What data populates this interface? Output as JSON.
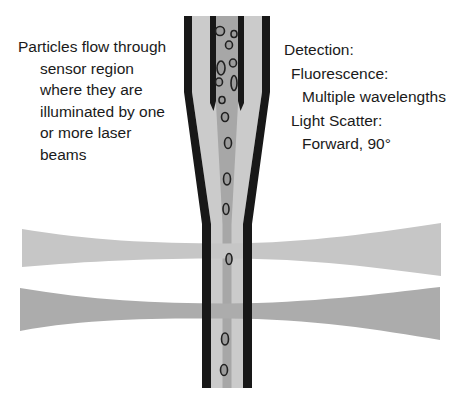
{
  "left_note": {
    "lines": [
      "Particles flow through",
      "sensor region",
      "where they are",
      "illuminated by one",
      "or more laser",
      "beams"
    ]
  },
  "detection_panel": {
    "title": "Detection:",
    "items": [
      {
        "label": "Fluorescence:",
        "detail": "Multiple wavelengths"
      },
      {
        "label": "Light Scatter:",
        "detail": "Forward, 90°"
      }
    ]
  },
  "colors": {
    "background": "#ffffff",
    "text": "#1a1a1a",
    "wall": "#181818",
    "sheath": "#cbcbcb",
    "core": "#a7a7a7",
    "beam_upper": "#c6c6c6",
    "beam_lower": "#acacac",
    "particle_fill": "#9b9b9b",
    "particle_stroke": "#202020"
  },
  "diagram": {
    "particles": [
      {
        "cx": 220,
        "cy": 31,
        "rx": 4.5,
        "ry": 4.5
      },
      {
        "cx": 234,
        "cy": 34,
        "rx": 3,
        "ry": 3.5
      },
      {
        "cx": 229,
        "cy": 45,
        "rx": 3.5,
        "ry": 4
      },
      {
        "cx": 233,
        "cy": 63,
        "rx": 3.5,
        "ry": 4
      },
      {
        "cx": 221,
        "cy": 68,
        "rx": 4,
        "ry": 7
      },
      {
        "cx": 219,
        "cy": 82,
        "rx": 3.5,
        "ry": 4
      },
      {
        "cx": 234,
        "cy": 83,
        "rx": 3,
        "ry": 7.5
      },
      {
        "cx": 222,
        "cy": 100,
        "rx": 3,
        "ry": 3.5
      },
      {
        "cx": 225,
        "cy": 117,
        "rx": 3.5,
        "ry": 4.5
      },
      {
        "cx": 228,
        "cy": 143,
        "rx": 3.5,
        "ry": 5.5
      },
      {
        "cx": 227,
        "cy": 179,
        "rx": 3.5,
        "ry": 6
      },
      {
        "cx": 226,
        "cy": 209,
        "rx": 3,
        "ry": 5.5
      },
      {
        "cx": 229,
        "cy": 259,
        "rx": 3,
        "ry": 5.5
      },
      {
        "cx": 225,
        "cy": 339,
        "rx": 3.5,
        "ry": 6
      },
      {
        "cx": 224,
        "cy": 370,
        "rx": 3.5,
        "ry": 5.5
      }
    ]
  }
}
